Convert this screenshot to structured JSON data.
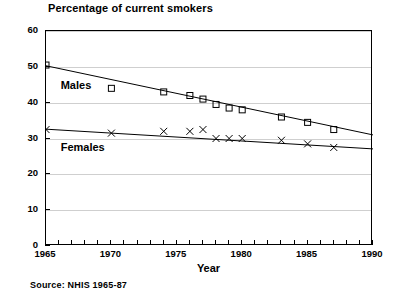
{
  "chart_data": {
    "type": "scatter",
    "title": "Percentage of current smokers",
    "xlabel": "Year",
    "ylabel": "",
    "xlim": [
      1965,
      1990
    ],
    "ylim": [
      0,
      60
    ],
    "grid": true,
    "legend_position": "inline-annotations",
    "xticks": [
      1965,
      1970,
      1975,
      1980,
      1985,
      1990
    ],
    "xtick_labels": [
      "1965",
      "1970",
      "1975",
      "1980",
      "1985",
      "1990"
    ],
    "yticks": [
      0,
      10,
      20,
      30,
      40,
      50,
      60
    ],
    "ytick_labels": [
      "0",
      "10",
      "20",
      "30",
      "40",
      "50",
      "60"
    ],
    "annotations": [
      {
        "text": "Males",
        "x": 1966.2,
        "y": 44.5
      },
      {
        "text": "Females",
        "x": 1966.2,
        "y": 27.0
      }
    ],
    "source": "Source: NHIS 1965-87",
    "series": [
      {
        "name": "Males",
        "marker": "square",
        "trend": true,
        "trend_start": {
          "x": 1965,
          "y": 50.3
        },
        "trend_end": {
          "x": 1990,
          "y": 31.0
        },
        "x": [
          1965,
          1970,
          1974,
          1976,
          1977,
          1978,
          1979,
          1980,
          1983,
          1985,
          1987
        ],
        "values": [
          50.5,
          44.0,
          43.0,
          42.0,
          41.0,
          39.5,
          38.5,
          38.0,
          36.0,
          34.5,
          32.5
        ]
      },
      {
        "name": "Females",
        "marker": "x",
        "trend": true,
        "trend_start": {
          "x": 1965,
          "y": 32.6
        },
        "trend_end": {
          "x": 1990,
          "y": 27.1
        },
        "x": [
          1965,
          1970,
          1974,
          1976,
          1977,
          1978,
          1979,
          1980,
          1983,
          1985,
          1987
        ],
        "values": [
          32.5,
          31.5,
          32.0,
          32.0,
          32.5,
          30.0,
          30.0,
          30.0,
          29.5,
          28.5,
          27.5
        ]
      }
    ]
  },
  "colors": {
    "axis": "#000000",
    "grid": "#cfcfcf",
    "series": "#000000"
  }
}
